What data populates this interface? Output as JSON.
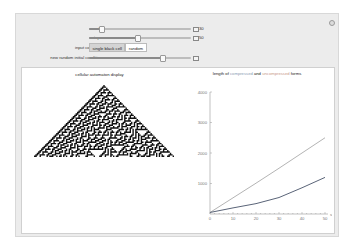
{
  "controls": {
    "rule": {
      "label": "rule",
      "value": "30",
      "knob_pct": 0.12
    },
    "steps": {
      "label": "steps",
      "value": "50",
      "knob_pct": 0.47
    },
    "input_condition": {
      "label": "input condition",
      "options": [
        "single black cell",
        "random"
      ],
      "selected": "single black cell"
    },
    "random_seed": {
      "label": "new random initial condition",
      "knob_pct": 0.72
    }
  },
  "options_icon": "gear-icon",
  "output": {
    "ca_title": "cellular automaton display",
    "plot_title_parts": {
      "p1": "length of ",
      "compressed": "compressed",
      "p2": " and ",
      "uncompressed": "uncompressed",
      "p3": " forms"
    }
  },
  "colors": {
    "compressed": "#5a6478",
    "uncompressed": "#b4b4b4",
    "panel_bg": "#ececec"
  },
  "chart_data": {
    "type": "line",
    "title": "length of compressed and uncompressed forms",
    "xlabel": "steps",
    "ylabel": "",
    "xlim": [
      0,
      50
    ],
    "ylim": [
      0,
      4000
    ],
    "x_ticks": [
      "0",
      "10",
      "20",
      "30",
      "40",
      "50"
    ],
    "y_ticks": [
      "1000",
      "2000",
      "3000",
      "4000"
    ],
    "x": [
      0,
      10,
      20,
      30,
      40,
      50
    ],
    "series": [
      {
        "name": "uncompressed",
        "values": [
          50,
          530,
          1010,
          1500,
          2000,
          2500
        ]
      },
      {
        "name": "compressed",
        "values": [
          50,
          200,
          340,
          540,
          860,
          1200
        ]
      }
    ]
  }
}
